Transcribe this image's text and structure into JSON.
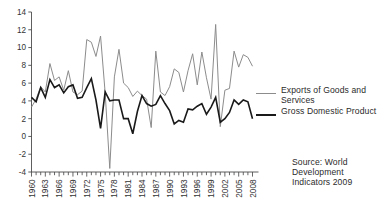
{
  "chart_data": {
    "type": "line",
    "title": "",
    "xlabel": "",
    "ylabel": "",
    "ylim": [
      -4,
      14
    ],
    "xlim": [
      1960,
      2008
    ],
    "grid": false,
    "ytick_values": [
      -4,
      -2,
      0,
      2,
      4,
      6,
      8,
      10,
      12,
      14
    ],
    "ytick_labels": [
      "-4",
      "-2",
      "0",
      "2",
      "4",
      "6",
      "8",
      "10",
      "12",
      "14"
    ],
    "xtick_labels": [
      "1960",
      "1963",
      "1966",
      "1969",
      "1972",
      "1975",
      "1978",
      "1981",
      "1984",
      "1987",
      "1990",
      "1993",
      "1996",
      "1999",
      "2002",
      "2005",
      "2008"
    ],
    "xtick_label_years": [
      1960,
      1963,
      1966,
      1969,
      1972,
      1975,
      1978,
      1981,
      1984,
      1987,
      1990,
      1993,
      1996,
      1999,
      2002,
      2005,
      2008
    ],
    "x": [
      1960,
      1961,
      1962,
      1963,
      1964,
      1965,
      1966,
      1967,
      1968,
      1969,
      1970,
      1971,
      1972,
      1973,
      1974,
      1975,
      1976,
      1977,
      1978,
      1979,
      1980,
      1981,
      1982,
      1983,
      1984,
      1985,
      1986,
      1987,
      1988,
      1989,
      1990,
      1991,
      1992,
      1993,
      1994,
      1995,
      1996,
      1997,
      1998,
      1999,
      2000,
      2001,
      2002,
      2003,
      2004,
      2005,
      2006,
      2007,
      2008
    ],
    "legend_position": "right",
    "series": [
      {
        "name": "Exports of Goods and Services",
        "color": "#8c8c8c",
        "linewidth": 1.0,
        "values": [
          3.3,
          4.2,
          5.6,
          5.0,
          8.2,
          6.3,
          6.7,
          5.2,
          7.4,
          5.0,
          4.7,
          5.1,
          10.9,
          10.6,
          9.0,
          11.3,
          4.9,
          -3.6,
          6.7,
          9.8,
          6.0,
          5.5,
          4.5,
          5.1,
          4.6,
          4.2,
          1.0,
          9.6,
          5.0,
          4.6,
          5.6,
          7.6,
          7.2,
          5.0,
          7.4,
          9.3,
          5.8,
          9.5,
          6.6,
          4.2,
          12.6,
          1.1,
          5.2,
          5.4,
          9.6,
          7.8,
          9.2,
          8.9,
          7.9
        ]
      },
      {
        "name": "Gross Domestic Product",
        "color": "#1a1a1a",
        "linewidth": 1.6,
        "values": [
          4.4,
          3.9,
          5.5,
          4.4,
          6.4,
          5.5,
          5.8,
          4.9,
          5.6,
          5.8,
          4.3,
          4.4,
          5.5,
          6.5,
          4.1,
          0.9,
          5.0,
          4.0,
          4.1,
          4.1,
          2.0,
          2.0,
          0.3,
          2.8,
          4.6,
          3.7,
          3.4,
          3.6,
          4.6,
          3.7,
          2.9,
          1.4,
          1.8,
          1.6,
          3.1,
          3.0,
          3.4,
          3.7,
          2.5,
          3.3,
          4.4,
          1.6,
          2.0,
          2.7,
          4.1,
          3.6,
          4.1,
          3.9,
          2.0
        ]
      }
    ],
    "source_note": "Source: World Development Indicators 2009"
  },
  "legend": {
    "items": [
      {
        "label_line1": "Exports of Goods and",
        "label_line2": "Services"
      },
      {
        "label_line1": "Gross Domestic Product",
        "label_line2": ""
      }
    ]
  },
  "source": {
    "line1": "Source: World",
    "line2": "Development",
    "line3": "Indicators 2009"
  }
}
